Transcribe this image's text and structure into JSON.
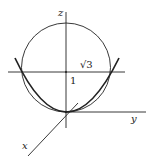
{
  "figure": {
    "type": "3d-axes-diagram",
    "axes": {
      "z_label": "z",
      "y_label": "y",
      "x_label": "x"
    },
    "annotations": {
      "sqrt3_label": "√3",
      "one_label": "1"
    },
    "elements": [
      {
        "kind": "circle",
        "description": "sphere cross-section centered on z-axis"
      },
      {
        "kind": "parabola",
        "description": "paraboloid cross-section with vertex at origin"
      },
      {
        "kind": "horizontal-line",
        "description": "plane z = 1 level"
      }
    ],
    "colors": {
      "stroke": "#222222",
      "background": "#ffffff"
    }
  }
}
